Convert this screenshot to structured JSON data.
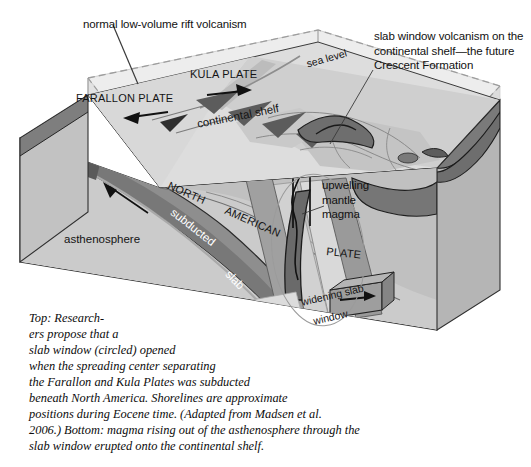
{
  "figure": {
    "type": "geological-block-diagram",
    "background_color": "#ffffff"
  },
  "annotations": [
    {
      "id": "rift-volcanism",
      "text": "normal low-volume rift volcanism",
      "leader_line": true
    },
    {
      "id": "slab-window-volcanism",
      "text": "slab window volcanism on the\ncontinental shelf—the future\nCrescent Formation",
      "leader_line": true
    },
    {
      "id": "upwelling-magma",
      "text": "upwelling\nmantle\nmagma",
      "leader_line": true
    }
  ],
  "block_labels": {
    "kula_plate": "KULA PLATE",
    "farallon_plate": "FARALLON PLATE",
    "sea_level": "sea level",
    "continental_shelf": "continental shelf",
    "asthenosphere": "asthenosphere",
    "north": "NORTH",
    "american": "AMERICAN",
    "plate": "PLATE",
    "subducted": "subducted",
    "slab": "slab",
    "widening_slab": "widening slab",
    "window": "window"
  },
  "caption": {
    "text": "Top: Research-\ners propose that a\nslab window (circled) opened\nwhen the spreading center separating\nthe Farallon and Kula Plates was subducted\nbeneath North America. Shorelines are approximate\npositions during Eocene time. (Adapted from Madsen et al.\n2006.) Bottom: magma rising out of the asthenosphere through the\nslab window erupted onto the continental shelf."
  },
  "colors": {
    "ink": "#111111",
    "water_top": "#e4e4e4",
    "block_face_light": "#d6d6d6",
    "block_face_mid": "#bdbdbd",
    "block_face_dark": "#9a9a9a",
    "slab_dark": "#8d8d8d",
    "slab_darker": "#6f6f6f",
    "magma_dark": "#5f5f5f",
    "volcanic_dark": "#727272",
    "shelf_light": "#cfcfcf",
    "outline": "#2a2a2a"
  }
}
